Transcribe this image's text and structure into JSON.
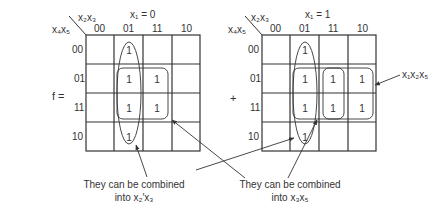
{
  "lhs": "f =",
  "plus": "+",
  "maps": [
    {
      "title": "x₁ = 0",
      "col_var": "x₂x₃",
      "row_var": "x₄x₅",
      "col_labels": [
        "00",
        "01",
        "11",
        "10"
      ],
      "row_labels": [
        "00",
        "01",
        "11",
        "10"
      ],
      "cells": [
        [
          "",
          "1",
          "",
          ""
        ],
        [
          "",
          "1",
          "1",
          ""
        ],
        [
          "",
          "1",
          "1",
          ""
        ],
        [
          "",
          "1",
          "",
          ""
        ]
      ]
    },
    {
      "title": "x₁ = 1",
      "col_var": "x₂x₃",
      "row_var": "x₄x₅",
      "col_labels": [
        "00",
        "01",
        "11",
        "10"
      ],
      "row_labels": [
        "00",
        "01",
        "11",
        "10"
      ],
      "cells": [
        [
          "",
          "1",
          "",
          ""
        ],
        [
          "",
          "1",
          "1",
          "1"
        ],
        [
          "",
          "1",
          "1",
          "1"
        ],
        [
          "",
          "1",
          "",
          ""
        ]
      ]
    }
  ],
  "annotations": {
    "right_label": "x₁x₂x₅",
    "left_note_line1": "They can be combined",
    "left_note_line2": "into x₂′x₃",
    "right_note_line1": "They can be combined",
    "right_note_line2": "into x₃x₅"
  }
}
